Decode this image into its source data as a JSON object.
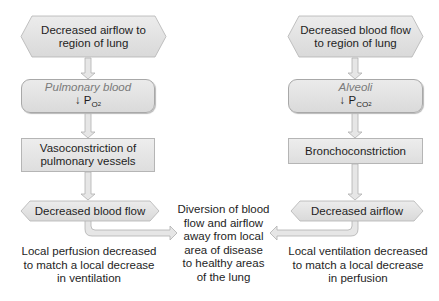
{
  "left_column": {
    "start": [
      "Decreased airflow to",
      "region of lung"
    ],
    "sensor": {
      "label": "Pulmonary blood",
      "arrow": "↓",
      "var": "P",
      "sub": "O",
      "sub2": "2"
    },
    "response": [
      "Vasoconstriction of",
      "pulmonary vessels"
    ],
    "result": "Decreased blood flow",
    "note": [
      "Local perfusion decreased",
      "to match a local decrease",
      "in ventilation"
    ]
  },
  "right_column": {
    "start": [
      "Decreased blood flow",
      "to region of lung"
    ],
    "sensor": {
      "label": "Alveoli",
      "arrow": "↓",
      "var": "P",
      "sub": "CO",
      "sub2": "2"
    },
    "response": [
      "Bronchoconstriction"
    ],
    "result": "Decreased airflow",
    "note": [
      "Local ventilation decreased",
      "to match a local decrease",
      "in perfusion"
    ]
  },
  "center_note": [
    "Diversion of blood",
    "flow and airflow",
    "away from local",
    "area of disease",
    "to healthy areas",
    "of the lung"
  ],
  "colors": {
    "box_fill": "#e2e2e2",
    "box_border": "#a8a8a8",
    "arrow_fill": "#e6e6e6",
    "arrow_stroke": "#b0b0b0"
  }
}
